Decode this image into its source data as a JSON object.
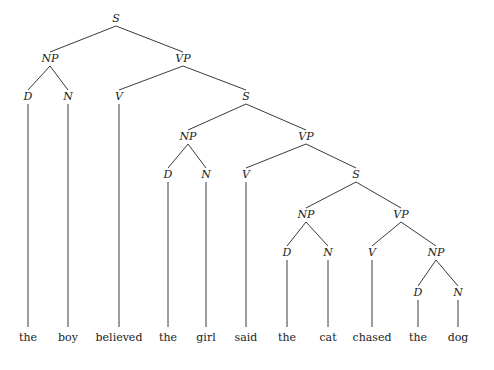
{
  "diagram": {
    "type": "syntax-tree",
    "sentence": "the boy believed the girl said the cat chased the dog",
    "nodes": [
      {
        "id": "s1",
        "label": "S",
        "x": 116,
        "y": 22
      },
      {
        "id": "np1",
        "label": "NP",
        "x": 50,
        "y": 62
      },
      {
        "id": "vp1",
        "label": "VP",
        "x": 183,
        "y": 62
      },
      {
        "id": "d1",
        "label": "D",
        "x": 28,
        "y": 100
      },
      {
        "id": "n1",
        "label": "N",
        "x": 68,
        "y": 100
      },
      {
        "id": "v1",
        "label": "V",
        "x": 119,
        "y": 100
      },
      {
        "id": "s2",
        "label": "S",
        "x": 246,
        "y": 100
      },
      {
        "id": "np2",
        "label": "NP",
        "x": 188,
        "y": 140
      },
      {
        "id": "vp2",
        "label": "VP",
        "x": 306,
        "y": 140
      },
      {
        "id": "d2",
        "label": "D",
        "x": 168,
        "y": 178
      },
      {
        "id": "n2",
        "label": "N",
        "x": 206,
        "y": 178
      },
      {
        "id": "v2",
        "label": "V",
        "x": 246,
        "y": 178
      },
      {
        "id": "s3",
        "label": "S",
        "x": 356,
        "y": 178
      },
      {
        "id": "np3",
        "label": "NP",
        "x": 306,
        "y": 218
      },
      {
        "id": "vp3",
        "label": "VP",
        "x": 401,
        "y": 218
      },
      {
        "id": "d3",
        "label": "D",
        "x": 287,
        "y": 256
      },
      {
        "id": "n3",
        "label": "N",
        "x": 328,
        "y": 256
      },
      {
        "id": "v3",
        "label": "V",
        "x": 372,
        "y": 256
      },
      {
        "id": "np4",
        "label": "NP",
        "x": 436,
        "y": 256
      },
      {
        "id": "d4",
        "label": "D",
        "x": 418,
        "y": 296
      },
      {
        "id": "n4",
        "label": "N",
        "x": 458,
        "y": 296
      }
    ],
    "edges": [
      [
        "s1",
        "np1"
      ],
      [
        "s1",
        "vp1"
      ],
      [
        "np1",
        "d1"
      ],
      [
        "np1",
        "n1"
      ],
      [
        "vp1",
        "v1"
      ],
      [
        "vp1",
        "s2"
      ],
      [
        "s2",
        "np2"
      ],
      [
        "s2",
        "vp2"
      ],
      [
        "np2",
        "d2"
      ],
      [
        "np2",
        "n2"
      ],
      [
        "vp2",
        "v2"
      ],
      [
        "vp2",
        "s3"
      ],
      [
        "s3",
        "np3"
      ],
      [
        "s3",
        "vp3"
      ],
      [
        "np3",
        "d3"
      ],
      [
        "np3",
        "n3"
      ],
      [
        "vp3",
        "v3"
      ],
      [
        "vp3",
        "np4"
      ],
      [
        "np4",
        "d4"
      ],
      [
        "np4",
        "n4"
      ]
    ],
    "words_y": 341,
    "words": [
      {
        "text": "the",
        "x": 28,
        "parent": "d1"
      },
      {
        "text": "boy",
        "x": 68,
        "parent": "n1"
      },
      {
        "text": "believed",
        "x": 119,
        "parent": "v1"
      },
      {
        "text": "the",
        "x": 168,
        "parent": "d2"
      },
      {
        "text": "girl",
        "x": 206,
        "parent": "n2"
      },
      {
        "text": "said",
        "x": 246,
        "parent": "v2"
      },
      {
        "text": "the",
        "x": 287,
        "parent": "d3"
      },
      {
        "text": "cat",
        "x": 328,
        "parent": "n3"
      },
      {
        "text": "chased",
        "x": 372,
        "parent": "v3"
      },
      {
        "text": "the",
        "x": 418,
        "parent": "d4"
      },
      {
        "text": "dog",
        "x": 458,
        "parent": "n4"
      }
    ]
  }
}
